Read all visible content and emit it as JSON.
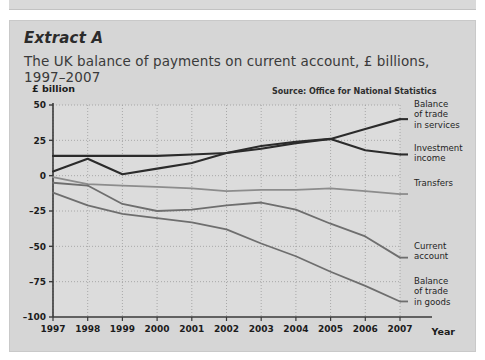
{
  "extract": {
    "label": "Extract A",
    "subtitle": "The UK balance of payments on current account, £ billions, 1997–2007"
  },
  "chart_data": {
    "type": "line",
    "title": "The UK balance of payments on current account, £ billions, 1997–2007",
    "source": "Source: Office for National Statistics",
    "ylabel": "£ billion",
    "xlabel": "Year",
    "ylim": [
      -100,
      50
    ],
    "yticks": [
      50,
      25,
      0,
      -25,
      -50,
      -75,
      -100
    ],
    "ytick_labels": [
      "50",
      "25",
      "0",
      "–25",
      "–50",
      "–75",
      "–100"
    ],
    "grid": true,
    "legend_position": "right",
    "categories": [
      "1997",
      "1998",
      "1999",
      "2000",
      "2001",
      "2002",
      "2003",
      "2004",
      "2005",
      "2006",
      "2007"
    ],
    "series": [
      {
        "name": "Balance of trade in services",
        "color": "#2b2b2b",
        "width": 2.1,
        "values": [
          14,
          14,
          14,
          14,
          15,
          16,
          19,
          23,
          26,
          33,
          40
        ]
      },
      {
        "name": "Investment income",
        "color": "#2b2b2b",
        "width": 2.1,
        "values": [
          3,
          12,
          1,
          5,
          9,
          16,
          21,
          24,
          26,
          18,
          15
        ]
      },
      {
        "name": "Transfers",
        "color": "#8c8c8c",
        "width": 1.8,
        "values": [
          -1,
          -6,
          -7,
          -8,
          -9,
          -11,
          -10,
          -10,
          -9,
          -11,
          -13
        ]
      },
      {
        "name": "Current account",
        "color": "#6e6e6e",
        "width": 1.8,
        "values": [
          -5,
          -7,
          -20,
          -25,
          -24,
          -21,
          -19,
          -24,
          -34,
          -43,
          -58
        ]
      },
      {
        "name": "Balance of trade in goods",
        "color": "#6e6e6e",
        "width": 1.8,
        "values": [
          -12,
          -21,
          -27,
          -30,
          -33,
          -38,
          -48,
          -57,
          -68,
          -78,
          -89
        ]
      }
    ],
    "legend_labels": [
      "Balance of trade in services",
      "Investment income",
      "Transfers",
      "Current account",
      "Balance of trade in goods"
    ]
  },
  "legend": {
    "services": {
      "l1": "Balance",
      "l2": "of trade",
      "l3": "in services"
    },
    "investment": {
      "l1": "Investment",
      "l2": "income",
      "l3": ""
    },
    "transfers": {
      "l1": "Transfers",
      "l2": "",
      "l3": ""
    },
    "current": {
      "l1": "Current",
      "l2": "account",
      "l3": ""
    },
    "goods": {
      "l1": "Balance",
      "l2": "of trade",
      "l3": "in goods"
    }
  }
}
